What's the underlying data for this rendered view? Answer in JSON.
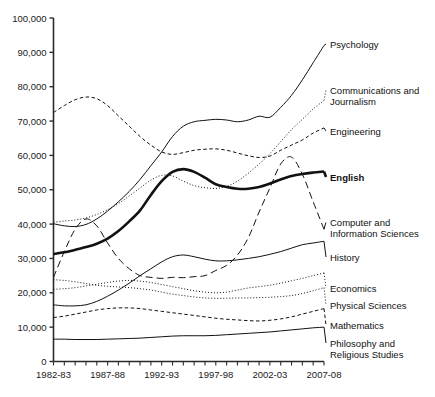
{
  "chart_data": {
    "type": "line",
    "title": "",
    "xlabel": "",
    "ylabel": "",
    "ylim": [
      0,
      100000
    ],
    "ytick_labels": [
      "0",
      "10,000",
      "20,000",
      "30,000",
      "40,000",
      "50,000",
      "60,000",
      "70,000",
      "80,000",
      "90,000",
      "100,000"
    ],
    "ytick_values": [
      0,
      10000,
      20000,
      30000,
      40000,
      50000,
      60000,
      70000,
      80000,
      90000,
      100000
    ],
    "x": [
      "1982-83",
      "1983-84",
      "1984-85",
      "1985-86",
      "1986-87",
      "1987-88",
      "1988-89",
      "1989-90",
      "1990-91",
      "1991-92",
      "1992-93",
      "1993-94",
      "1994-95",
      "1995-96",
      "1996-97",
      "1997-98",
      "1998-99",
      "1999-00",
      "2000-01",
      "2001-02",
      "2002-03",
      "2003-04",
      "2004-05",
      "2005-06",
      "2006-07",
      "2007-08"
    ],
    "xtick_labels": [
      "1982-83",
      "1987-88",
      "1992-93",
      "1997-98",
      "2002-03",
      "2007-08"
    ],
    "xtick_positions": [
      0,
      5,
      10,
      15,
      20,
      25
    ],
    "grid": false,
    "legend_position": "right-inline",
    "series": [
      {
        "name": "Psychology",
        "label": "Psychology",
        "style": "solid",
        "weight": "normal",
        "label_y": 44,
        "values": [
          40100,
          39500,
          39300,
          39900,
          41500,
          43800,
          46500,
          49500,
          53000,
          57000,
          61000,
          65500,
          68500,
          69800,
          70200,
          70500,
          70300,
          69800,
          70300,
          71400,
          71100,
          74000,
          77500,
          82000,
          87000,
          92000
        ]
      },
      {
        "name": "Communications and Journalism",
        "label": "Communications and Journalism",
        "style": "dotted",
        "weight": "normal",
        "label_y": 90,
        "values": [
          40500,
          40900,
          41200,
          41800,
          42800,
          44200,
          46000,
          48200,
          50500,
          52800,
          54200,
          54000,
          52500,
          51200,
          50600,
          50400,
          51000,
          52500,
          54800,
          57500,
          60500,
          64000,
          67500,
          70500,
          73500,
          76000
        ]
      },
      {
        "name": "Engineering",
        "label": "Engineering",
        "style": "dashed",
        "weight": "normal",
        "label_y": 131,
        "values": [
          72500,
          74500,
          76200,
          77000,
          76500,
          74500,
          71500,
          68500,
          65500,
          63000,
          61000,
          60300,
          60800,
          61500,
          61800,
          61900,
          61500,
          60700,
          59900,
          59400,
          59800,
          61500,
          63000,
          64500,
          66500,
          68000
        ]
      },
      {
        "name": "English",
        "label": "English",
        "style": "solid",
        "weight": "bold",
        "label_y": 177,
        "values": [
          31300,
          31800,
          32500,
          33300,
          34300,
          35800,
          38000,
          40800,
          44000,
          48500,
          52500,
          55200,
          56000,
          55200,
          53500,
          51600,
          50800,
          50300,
          50300,
          50800,
          51800,
          53000,
          54000,
          54600,
          55000,
          55300
        ]
      },
      {
        "name": "Computer and Information Sciences",
        "label": "Computer and Information Sciences",
        "style": "dashed-long",
        "weight": "normal",
        "label_y": 222,
        "values": [
          24500,
          32000,
          38500,
          41500,
          39500,
          34500,
          30000,
          27000,
          25000,
          24500,
          24200,
          24500,
          24400,
          24700,
          25000,
          26500,
          28000,
          31000,
          36000,
          43500,
          50500,
          57500,
          59500,
          54500,
          46500,
          38500
        ]
      },
      {
        "name": "History",
        "label": "History",
        "style": "solid",
        "weight": "normal",
        "label_y": 257,
        "values": [
          16500,
          16200,
          16200,
          16500,
          17500,
          19000,
          20800,
          22800,
          25000,
          27000,
          29000,
          30500,
          31000,
          30500,
          29800,
          29300,
          29300,
          29600,
          30000,
          30500,
          31200,
          32000,
          33000,
          34000,
          34500,
          35000
        ]
      },
      {
        "name": "Economics",
        "label": "Economics",
        "style": "dotted",
        "weight": "normal",
        "label_y": 288,
        "values": [
          21000,
          21200,
          21500,
          22000,
          22500,
          23000,
          23400,
          23600,
          23400,
          23000,
          22400,
          21800,
          21200,
          20600,
          20200,
          20000,
          20200,
          20800,
          21400,
          21800,
          22200,
          22800,
          23500,
          24200,
          25000,
          25800
        ]
      },
      {
        "name": "Physical Sciences",
        "label": "Physical Sciences",
        "style": "dotted",
        "weight": "normal",
        "label_y": 305,
        "values": [
          23800,
          23600,
          23200,
          22700,
          22200,
          21900,
          21700,
          21500,
          21200,
          20800,
          20200,
          19600,
          19200,
          18800,
          18500,
          18400,
          18400,
          18500,
          18500,
          18600,
          18700,
          18900,
          19200,
          19800,
          20600,
          21500
        ]
      },
      {
        "name": "Mathematics",
        "label": "Mathematics",
        "style": "dashed",
        "weight": "normal",
        "label_y": 325,
        "values": [
          12800,
          13200,
          13800,
          14400,
          15000,
          15400,
          15600,
          15600,
          15400,
          15000,
          14600,
          14200,
          13800,
          13400,
          13000,
          12600,
          12300,
          12100,
          11900,
          11800,
          12000,
          12400,
          13000,
          13800,
          14600,
          15400
        ]
      },
      {
        "name": "Philosophy and Religious Studies",
        "label": "Philosophy and Religious Studies",
        "style": "solid",
        "weight": "normal",
        "label_y": 343,
        "values": [
          6500,
          6500,
          6400,
          6400,
          6400,
          6500,
          6600,
          6700,
          6800,
          7000,
          7200,
          7400,
          7500,
          7500,
          7500,
          7600,
          7800,
          8000,
          8200,
          8400,
          8600,
          8900,
          9200,
          9500,
          9800,
          10000
        ]
      }
    ]
  }
}
